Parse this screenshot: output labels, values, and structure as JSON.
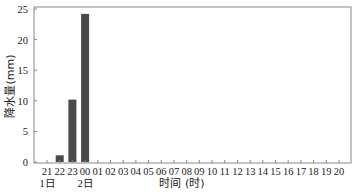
{
  "chart_data": {
    "type": "bar",
    "title": "",
    "xlabel": "时间 (时)",
    "ylabel": "降水量(mm)",
    "ylim": [
      0,
      25
    ],
    "yticks": [
      0,
      5,
      10,
      15,
      20,
      25
    ],
    "grid": false,
    "legend": null,
    "categories": [
      "21",
      "22",
      "23",
      "00",
      "01",
      "02",
      "03",
      "04",
      "05",
      "06",
      "07",
      "08",
      "09",
      "10",
      "11",
      "12",
      "13",
      "14",
      "15",
      "16",
      "17",
      "18",
      "19",
      "20"
    ],
    "day_labels": [
      {
        "at": "21",
        "label": "1日"
      },
      {
        "at": "00",
        "label": "2日"
      }
    ],
    "values": [
      0,
      1.1,
      10.2,
      24.2,
      0,
      0,
      0,
      0,
      0,
      0,
      0,
      0,
      0,
      0,
      0,
      0,
      0,
      0,
      0,
      0,
      0,
      0,
      0,
      0
    ],
    "bar_color": "#4a4a4a"
  }
}
